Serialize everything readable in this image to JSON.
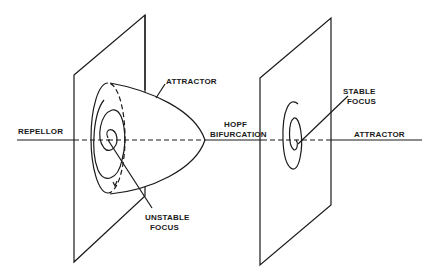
{
  "diagram": {
    "labels": {
      "repellor": "REPELLOR",
      "attractor_cone": "ATTRACTOR",
      "unstable_focus_1": "UNSTABLE",
      "unstable_focus_2": "FOCUS",
      "hopf_1": "HOPF",
      "hopf_2": "BIFURCATION",
      "stable_focus_1": "STABLE",
      "stable_focus_2": "FOCUS",
      "attractor_right": "ATTRACTOR"
    },
    "colors": {
      "ink": "#1a1a1a",
      "background": "#ffffff"
    }
  }
}
